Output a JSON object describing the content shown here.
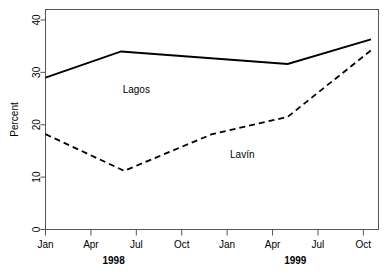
{
  "chart_data": {
    "type": "line",
    "title": "",
    "xlabel": "",
    "ylabel": "Percent",
    "ylim": [
      0,
      42
    ],
    "yticks": [
      0,
      10,
      20,
      30,
      40
    ],
    "ytick_labels": [
      "0",
      "10",
      "20",
      "30",
      "40"
    ],
    "grid": false,
    "legend_position": "inline-annotation",
    "x": [
      "Jan 1998",
      "Apr 1998",
      "Jun 1998",
      "Oct 1998",
      "Jan 1999",
      "May 1999",
      "Jul 1999",
      "Oct 1999"
    ],
    "xtick_labels": [
      "Jan",
      "Apr",
      "Jul",
      "Oct",
      "Jan",
      "Apr",
      "Jul",
      "Oct"
    ],
    "xtick_positions_months": [
      0,
      3,
      6,
      9,
      12,
      15,
      18,
      21
    ],
    "group_labels": [
      {
        "label": "1998",
        "center_month": 4.5
      },
      {
        "label": "1999",
        "center_month": 16.5
      }
    ],
    "series": [
      {
        "name": "Lagos",
        "style": "solid",
        "color": "#000000",
        "points": [
          {
            "month": 0,
            "value": 29.0
          },
          {
            "month": 5,
            "value": 34.0
          },
          {
            "month": 16,
            "value": 31.6
          },
          {
            "month": 21.5,
            "value": 36.3
          }
        ]
      },
      {
        "name": "Lavín",
        "style": "dashed",
        "color": "#000000",
        "points": [
          {
            "month": 0,
            "value": 18.2
          },
          {
            "month": 5.2,
            "value": 11.2
          },
          {
            "month": 11,
            "value": 18.2
          },
          {
            "month": 16,
            "value": 21.5
          },
          {
            "month": 21.5,
            "value": 34.2
          }
        ]
      }
    ],
    "annotations": [
      {
        "text": "Lagos",
        "month": 6.0,
        "value": 26.0
      },
      {
        "text": "Lavín",
        "month": 13.0,
        "value": 13.6
      }
    ]
  }
}
